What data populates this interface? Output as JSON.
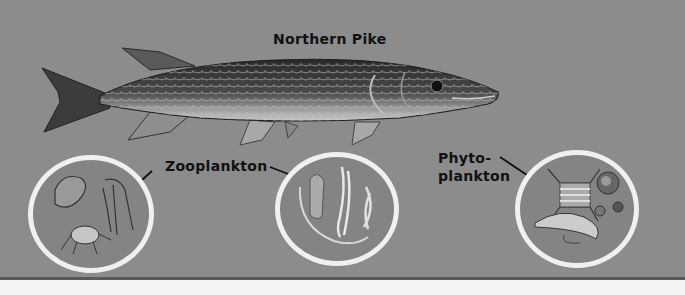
{
  "title": "Northern Pike",
  "labels": {
    "fish": "Northern Pike",
    "zooplankton": "Zooplankton",
    "phytoplankton_line1": "Phyto-",
    "phytoplankton_line2": "plankton"
  },
  "circles": [
    {
      "name": "zooplankton-circle-left",
      "content": "zooplankton"
    },
    {
      "name": "zooplankton-circle-middle",
      "content": "zooplankton"
    },
    {
      "name": "phytoplankton-circle",
      "content": "phytoplankton"
    }
  ],
  "colors": {
    "background": "#8c8c8c",
    "circle_border": "#f0f0f0",
    "page": "#f4f4f4",
    "text": "#111111"
  }
}
